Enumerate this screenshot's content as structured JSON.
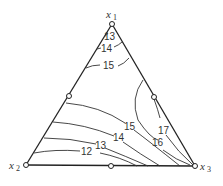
{
  "diagram": {
    "type": "ternary contour plot",
    "vertices": [
      {
        "name": "x",
        "sub": "1",
        "position": "top"
      },
      {
        "name": "x",
        "sub": "2",
        "position": "bottom-left"
      },
      {
        "name": "x",
        "sub": "3",
        "position": "bottom-right"
      }
    ],
    "contour_labels": {
      "top_13": "13",
      "top_14": "14",
      "top_15": "15",
      "low_15": "15",
      "low_14": "14",
      "low_13": "13",
      "low_12": "12",
      "right_16": "16",
      "right_17": "17"
    },
    "design_points": 6
  }
}
